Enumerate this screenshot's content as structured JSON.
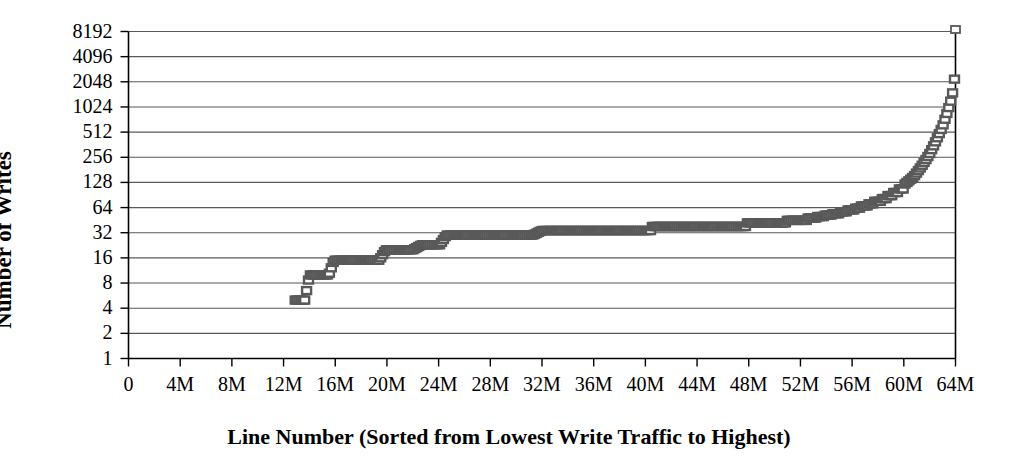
{
  "chart_data": {
    "type": "scatter",
    "title": "",
    "subtitle": "",
    "xlabel": "Line Number (Sorted from Lowest Write Traffic to Highest)",
    "ylabel": "Number of Writes",
    "yscale": "log2",
    "ylim": [
      1,
      8192
    ],
    "xlim": [
      0,
      64000000
    ],
    "grid": "horizontal",
    "legend": "none",
    "marker": "open-square",
    "marker_color": "#595959",
    "y_ticks": [
      1,
      2,
      4,
      8,
      16,
      32,
      64,
      128,
      256,
      512,
      1024,
      2048,
      4096,
      8192
    ],
    "y_tick_labels": [
      "1",
      "2",
      "4",
      "8",
      "16",
      "32",
      "64",
      "128",
      "256",
      "512",
      "1024",
      "2048",
      "4096",
      "8192"
    ],
    "x_ticks": [
      0,
      4000000,
      8000000,
      12000000,
      16000000,
      20000000,
      24000000,
      28000000,
      32000000,
      36000000,
      40000000,
      44000000,
      48000000,
      52000000,
      56000000,
      60000000,
      64000000
    ],
    "x_tick_labels": [
      "0",
      "4M",
      "8M",
      "12M",
      "16M",
      "20M",
      "24M",
      "28M",
      "32M",
      "36M",
      "40M",
      "44M",
      "48M",
      "52M",
      "56M",
      "60M",
      "64M"
    ],
    "series": [
      {
        "name": "writes per line",
        "note": "Step-shaped cumulative distribution: no markers below ~12.9M lines, then discrete plateaus rising from 5 writes to ~48 writes, followed by a steep rise to 8192 writes at the last line.",
        "points": [
          [
            12900000,
            5
          ],
          [
            13150000,
            5
          ],
          [
            13400000,
            5
          ],
          [
            13650000,
            5
          ],
          [
            14000000,
            10
          ],
          [
            14300000,
            10
          ],
          [
            14600000,
            10
          ],
          [
            14900000,
            10
          ],
          [
            15200000,
            10
          ],
          [
            15500000,
            10
          ],
          [
            15900000,
            15
          ],
          [
            16300000,
            15
          ],
          [
            16700000,
            15
          ],
          [
            17100000,
            15
          ],
          [
            17500000,
            15
          ],
          [
            17900000,
            15
          ],
          [
            18300000,
            15
          ],
          [
            18700000,
            15
          ],
          [
            19100000,
            15
          ],
          [
            19400000,
            15
          ],
          [
            19900000,
            20
          ],
          [
            20600000,
            20
          ],
          [
            21300000,
            20
          ],
          [
            22000000,
            20
          ],
          [
            22700000,
            23
          ],
          [
            23400000,
            23
          ],
          [
            24100000,
            23
          ],
          [
            24600000,
            30
          ],
          [
            25600000,
            30
          ],
          [
            26600000,
            30
          ],
          [
            27600000,
            30
          ],
          [
            28600000,
            30
          ],
          [
            29600000,
            30
          ],
          [
            30600000,
            30
          ],
          [
            31300000,
            30
          ],
          [
            32000000,
            34
          ],
          [
            33400000,
            34
          ],
          [
            34800000,
            34
          ],
          [
            36200000,
            34
          ],
          [
            37600000,
            34
          ],
          [
            39000000,
            34
          ],
          [
            39900000,
            34
          ],
          [
            40400000,
            38
          ],
          [
            41600000,
            38
          ],
          [
            42800000,
            38
          ],
          [
            44000000,
            38
          ],
          [
            45200000,
            38
          ],
          [
            46400000,
            38
          ],
          [
            47200000,
            38
          ],
          [
            47800000,
            42
          ],
          [
            48800000,
            42
          ],
          [
            49800000,
            42
          ],
          [
            50300000,
            42
          ],
          [
            50900000,
            45
          ],
          [
            51500000,
            45
          ],
          [
            52100000,
            45
          ],
          [
            52600000,
            48
          ],
          [
            53200000,
            50
          ],
          [
            53800000,
            52
          ],
          [
            54400000,
            54
          ],
          [
            55000000,
            57
          ],
          [
            55600000,
            60
          ],
          [
            56200000,
            63
          ],
          [
            56700000,
            67
          ],
          [
            57200000,
            71
          ],
          [
            57700000,
            76
          ],
          [
            58200000,
            82
          ],
          [
            58700000,
            89
          ],
          [
            59200000,
            97
          ],
          [
            59600000,
            107
          ],
          [
            60000000,
            119
          ],
          [
            60400000,
            134
          ],
          [
            60800000,
            152
          ],
          [
            61100000,
            175
          ],
          [
            61400000,
            203
          ],
          [
            61700000,
            238
          ],
          [
            62000000,
            282
          ],
          [
            62250000,
            337
          ],
          [
            62500000,
            406
          ],
          [
            62750000,
            493
          ],
          [
            63000000,
            600
          ],
          [
            63200000,
            740
          ],
          [
            63400000,
            920
          ],
          [
            63600000,
            1150
          ],
          [
            63750000,
            1450
          ],
          [
            63900000,
            1850
          ],
          [
            64000000,
            4096
          ],
          [
            64000000,
            8192
          ]
        ],
        "values_summary": {
          "min_write_count": 5,
          "max_write_count": 8192,
          "first_written_line_approx": 12900000,
          "lines_with_zero_writes_approx": 12900000,
          "total_lines": 64000000
        }
      }
    ]
  },
  "axes": {
    "ylabel": "Number of Writes",
    "xlabel": "Line Number (Sorted from Lowest Write Traffic to Highest)"
  },
  "style": {
    "plot_border_color": "#000000",
    "gridline_color": "#595959",
    "background": "#ffffff",
    "marker_fill": "#ffffff",
    "marker_stroke": "#595959",
    "band_color": "#5e5e5e"
  }
}
